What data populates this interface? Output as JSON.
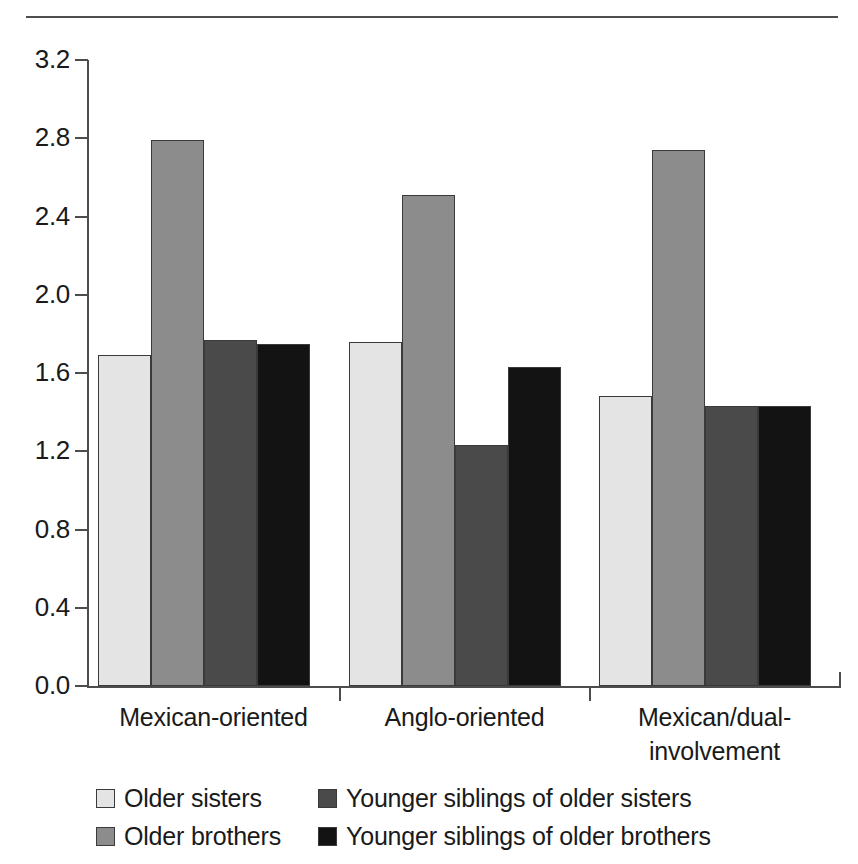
{
  "chart_data": {
    "type": "bar",
    "title": "",
    "subtitle": "",
    "xlabel": "",
    "ylabel": "",
    "ylim": [
      0.0,
      3.2
    ],
    "yticks": [
      "0.0",
      "0.4",
      "0.8",
      "1.2",
      "1.6",
      "2.0",
      "2.4",
      "2.8",
      "3.2"
    ],
    "ytick_values": [
      0.0,
      0.4,
      0.8,
      1.2,
      1.6,
      2.0,
      2.4,
      2.8,
      3.2
    ],
    "grid": false,
    "legend_position": "bottom",
    "categories": [
      "Mexican-oriented",
      "Anglo-oriented",
      "Mexican/dual-involvement"
    ],
    "category_label_lines": [
      [
        "Mexican-oriented"
      ],
      [
        "Anglo-oriented"
      ],
      [
        "Mexican/dual-",
        "involvement"
      ]
    ],
    "series": [
      {
        "name": "Older sisters",
        "color": "#e4e4e4",
        "values": [
          1.69,
          1.76,
          1.48
        ]
      },
      {
        "name": "Older brothers",
        "color": "#8c8c8c",
        "values": [
          2.79,
          2.51,
          2.74
        ]
      },
      {
        "name": "Younger siblings of older sisters",
        "color": "#4a4a4a",
        "values": [
          1.77,
          1.23,
          1.43
        ]
      },
      {
        "name": "Younger siblings of older brothers",
        "color": "#131313",
        "values": [
          1.75,
          1.63,
          1.43
        ]
      }
    ]
  },
  "legend": {
    "entries": [
      {
        "label": "Older sisters",
        "color": "#e4e4e4"
      },
      {
        "label": "Older brothers",
        "color": "#8c8c8c"
      },
      {
        "label": "Younger siblings of older sisters",
        "color": "#4a4a4a"
      },
      {
        "label": "Younger siblings of older brothers",
        "color": "#131313"
      }
    ]
  },
  "colors": {
    "axis": "#4d4d4d",
    "rule": "#4d4d4d",
    "text": "#1a1a1a",
    "background": "#ffffff"
  }
}
